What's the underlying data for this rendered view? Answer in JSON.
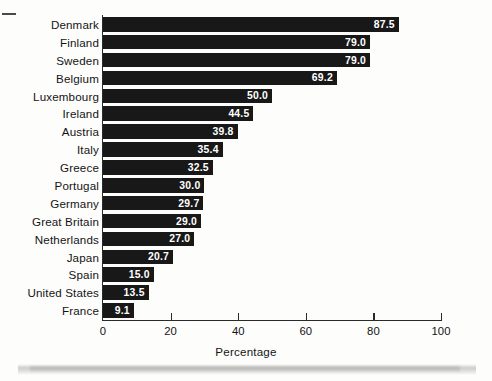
{
  "chart_data": {
    "type": "bar",
    "orientation": "horizontal",
    "title": "",
    "xlabel": "Percentage",
    "ylabel": "",
    "xlim": [
      0,
      100
    ],
    "xticks": [
      0,
      20,
      40,
      60,
      80,
      100
    ],
    "xtick_labels": [
      "0",
      "20",
      "40",
      "60",
      "80",
      "100"
    ],
    "grid": false,
    "legend": null,
    "categories": [
      "Denmark",
      "Finland",
      "Sweden",
      "Belgium",
      "Luxembourg",
      "Ireland",
      "Austria",
      "Italy",
      "Greece",
      "Portugal",
      "Germany",
      "Great Britain",
      "Netherlands",
      "Japan",
      "Spain",
      "United States",
      "France"
    ],
    "values": [
      87.5,
      79.0,
      79.0,
      69.2,
      50.0,
      44.5,
      39.8,
      35.4,
      32.5,
      30.0,
      29.7,
      29.0,
      27.0,
      20.7,
      15.0,
      13.5,
      9.1
    ],
    "value_labels": [
      "87.5",
      "79.0",
      "79.0",
      "69.2",
      "50.0",
      "44.5",
      "39.8",
      "35.4",
      "32.5",
      "30.0",
      "29.7",
      "29.0",
      "27.0",
      "20.7",
      "15.0",
      "13.5",
      "9.1"
    ],
    "bar_color": "#181818",
    "value_label_color": "#ffffff",
    "axis_color": "#2a2a2a",
    "background_color": "#fdfdfc"
  }
}
